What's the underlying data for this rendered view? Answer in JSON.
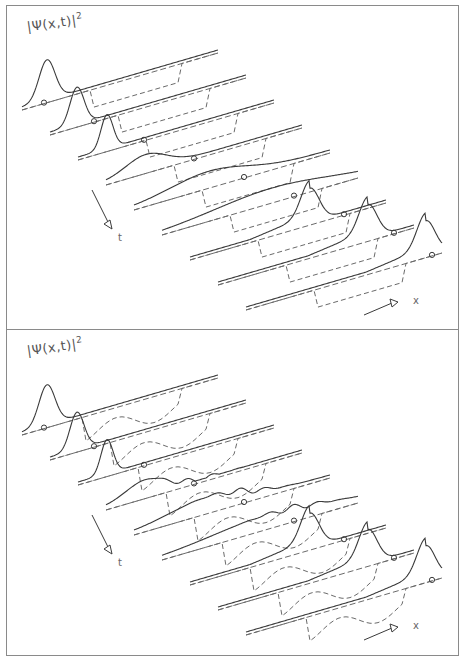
{
  "figure": {
    "panels": [
      {
        "id": "top",
        "label_main": "|Ψ(x,t)|",
        "label_sup": "2",
        "time_axis_label": "t",
        "space_axis_label": "x",
        "description": "Wave packet scattering off barrier, nine time slices; packet fully transmitted"
      },
      {
        "id": "bottom",
        "label_main": "|Ψ(x,t)|",
        "label_sup": "2",
        "time_axis_label": "t",
        "space_axis_label": "x",
        "description": "Wave packet scattering off irregular potential, nine time slices; packet transmitted"
      }
    ],
    "colors": {
      "frame": "#8a8a8a",
      "curve": "#3a3a3a",
      "dashed": "#6a6a6a",
      "background": "#ffffff"
    }
  }
}
